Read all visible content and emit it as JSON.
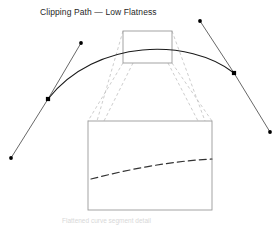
{
  "figure": {
    "title": "Clipping Path — Low Flatness",
    "caption": "Flattened curve segment detail",
    "colors": {
      "curve": "#1a1a1a",
      "handle_line": "#4d4d4d",
      "marker": "#000000",
      "box_stroke": "#9a9a9a",
      "connector_dash": "#c0c0c0",
      "flattened_curve": "#333333",
      "background": "#ffffff",
      "title_text": "#262626"
    }
  },
  "chart_data": {
    "type": "line",
    "title": "Clipping Path — Low Flatness",
    "xlabel": "",
    "ylabel": "",
    "xlim": [
      0,
      280
    ],
    "ylim": [
      225,
      0
    ],
    "grid": false,
    "legend": "none",
    "series": [
      {
        "name": "bezier-clipping-path",
        "kind": "cubic-bezier",
        "start": [
          48,
          99
        ],
        "control1": [
          96,
          38
        ],
        "control2": [
          190,
          38
        ],
        "end": [
          234,
          73
        ],
        "stroke": "#1a1a1a",
        "stroke_width": 1.1
      },
      {
        "name": "flattened-curve-detail",
        "kind": "cubic-bezier-dashed",
        "start": [
          91,
          179
        ],
        "control1": [
          130,
          169
        ],
        "control2": [
          172,
          161
        ],
        "end": [
          212,
          159
        ],
        "stroke": "#333333",
        "stroke_width": 1.2,
        "dash": "7 4"
      }
    ],
    "control_handles": [
      {
        "name": "left-anchor",
        "anchor": [
          48,
          99
        ],
        "handle_out": [
          81,
          43
        ],
        "handle_in": [
          11,
          158
        ]
      },
      {
        "name": "right-anchor",
        "anchor": [
          234,
          73
        ],
        "handle_out": [
          200,
          21
        ],
        "handle_in": [
          270,
          132
        ]
      }
    ],
    "anchor_markers": [
      {
        "name": "left-anchor-square",
        "x": 48,
        "y": 99,
        "size": 4.2,
        "shape": "square"
      },
      {
        "name": "right-anchor-square",
        "x": 234,
        "y": 73,
        "size": 4.2,
        "shape": "square"
      }
    ],
    "handle_dots": [
      {
        "name": "upper-left-handle-dot",
        "x": 81,
        "y": 43,
        "r": 1.9
      },
      {
        "name": "lower-left-handle-dot",
        "x": 11,
        "y": 158,
        "r": 1.9
      },
      {
        "name": "upper-right-handle-dot",
        "x": 200,
        "y": 21,
        "r": 1.9
      },
      {
        "name": "lower-right-handle-dot",
        "x": 270,
        "y": 132,
        "r": 1.9
      }
    ],
    "zoom_region_box": {
      "name": "zoom-region",
      "x": 123,
      "y": 31,
      "width": 49,
      "height": 32,
      "stroke": "#9a9a9a"
    },
    "detail_box": {
      "name": "detail-view",
      "x": 88,
      "y": 121,
      "width": 124,
      "height": 89,
      "stroke": "#9a9a9a"
    },
    "connectors": [
      {
        "name": "connector-outer-left",
        "from": [
          123,
          63
        ],
        "to": [
          88,
          121
        ]
      },
      {
        "name": "connector-inner-left",
        "from": [
          123,
          31
        ],
        "to": [
          97,
          121
        ]
      },
      {
        "name": "connector-mid-left",
        "from": [
          133,
          63
        ],
        "to": [
          104,
          121
        ]
      },
      {
        "name": "connector-mid-right",
        "from": [
          168,
          63
        ],
        "to": [
          198,
          121
        ]
      },
      {
        "name": "connector-inner-right",
        "from": [
          172,
          31
        ],
        "to": [
          205,
          121
        ]
      },
      {
        "name": "connector-outer-right",
        "from": [
          172,
          63
        ],
        "to": [
          212,
          121
        ]
      }
    ]
  }
}
